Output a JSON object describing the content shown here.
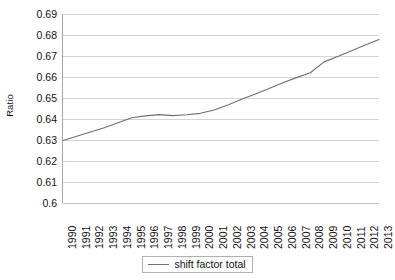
{
  "chart_data": {
    "type": "line",
    "title": "",
    "xlabel": "",
    "ylabel": "Ratio",
    "ylim": [
      0.6,
      0.69
    ],
    "ytick_step": 0.01,
    "ytick_labels": [
      "0.69",
      "0.68",
      "0.67",
      "0.66",
      "0.65",
      "0.64",
      "0.63",
      "0.62",
      "0.61",
      "0.6"
    ],
    "grid": true,
    "legend_position": "bottom-center",
    "categories": [
      "1990",
      "1991",
      "1992",
      "1993",
      "1994",
      "1995",
      "1996",
      "1997",
      "1998",
      "1999",
      "2000",
      "2001",
      "2002",
      "2003",
      "2004",
      "2005",
      "2006",
      "2007",
      "2008",
      "2009",
      "2010",
      "2011",
      "2012",
      "2013"
    ],
    "series": [
      {
        "name": "shift factor total",
        "color": "#6e6e6e",
        "values": [
          0.6298,
          0.6318,
          0.6338,
          0.6358,
          0.6382,
          0.6406,
          0.6415,
          0.6421,
          0.6416,
          0.642,
          0.6427,
          0.6443,
          0.6467,
          0.6494,
          0.6519,
          0.6545,
          0.6573,
          0.6597,
          0.662,
          0.6672,
          0.6698,
          0.6725,
          0.6752,
          0.6779
        ]
      }
    ]
  },
  "legend": {
    "entries": [
      {
        "label": "shift factor total"
      }
    ]
  },
  "colors": {
    "series_line": "#6e6e6e",
    "gridline": "#d4d4d4",
    "axis": "#a6a6a6",
    "text": "#111111",
    "background": "#ffffff"
  }
}
